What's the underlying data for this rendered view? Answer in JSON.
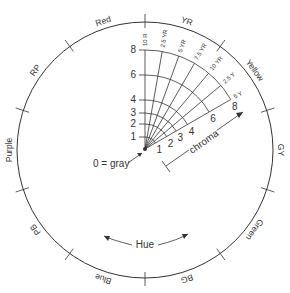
{
  "diagram": {
    "center": {
      "x": 145,
      "y": 150
    },
    "radius": 128,
    "line_color": "#333333",
    "hues": [
      {
        "label": "Red",
        "angle": -108
      },
      {
        "label": "YR",
        "angle": -72
      },
      {
        "label": "Yellow",
        "angle": -36
      },
      {
        "label": "GY",
        "angle": 0
      },
      {
        "label": "Green",
        "angle": 36
      },
      {
        "label": "BG",
        "angle": 72
      },
      {
        "label": "Blue",
        "angle": 108
      },
      {
        "label": "PB",
        "angle": 144
      },
      {
        "label": "Purple",
        "angle": 180
      },
      {
        "label": "RP",
        "angle": 216
      }
    ],
    "fan_hue_labels": [
      "10 R",
      "2.5 YR",
      "5 YR",
      "7.5 YR",
      "10 YR",
      "2.5 Y",
      "5 Y"
    ],
    "vertical_chroma_labels": [
      "1",
      "2",
      "3",
      "4",
      "6",
      "8"
    ],
    "diagonal_chroma_labels": [
      "1",
      "2",
      "3",
      "4",
      "6",
      "8"
    ],
    "origin_label": "0 = gray",
    "chroma_label": "chroma",
    "hue_label": "Hue"
  }
}
